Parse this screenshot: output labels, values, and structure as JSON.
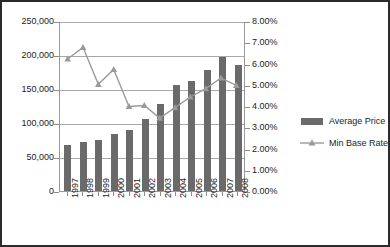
{
  "chart_data": {
    "type": "bar",
    "title": "",
    "subtitle": "",
    "xlabel": "",
    "ylabel": "",
    "categories": [
      "1997",
      "1998",
      "1999",
      "2000",
      "2001",
      "2002",
      "2003",
      "2004",
      "2005",
      "2006",
      "2007",
      "2008"
    ],
    "series": [
      {
        "name": "Average Price",
        "type": "bar",
        "axis": "left",
        "values": [
          67000,
          71500,
          75500,
          84500,
          90000,
          105500,
          128000,
          156500,
          162500,
          178500,
          197000,
          185500
        ]
      },
      {
        "name": "Min Base Rate",
        "type": "line",
        "axis": "right",
        "marker": "triangle",
        "values": [
          6.25,
          6.8,
          5.05,
          5.75,
          4.0,
          4.05,
          3.45,
          3.95,
          4.45,
          4.85,
          5.35,
          5.0
        ]
      }
    ],
    "left_axis": {
      "ticks": [
        "0",
        "50,000",
        "100,000",
        "150,000",
        "200,000",
        "250,000"
      ],
      "tick_values": [
        0,
        50000,
        100000,
        150000,
        200000,
        250000
      ],
      "ylim": [
        0,
        250000
      ]
    },
    "right_axis": {
      "ticks": [
        "0.00%",
        "1.00%",
        "2.00%",
        "3.00%",
        "4.00%",
        "5.00%",
        "6.00%",
        "7.00%",
        "8.00%"
      ],
      "tick_values": [
        0,
        1,
        2,
        3,
        4,
        5,
        6,
        7,
        8
      ],
      "ylim": [
        0,
        8
      ]
    },
    "grid": true,
    "legend": {
      "position": "right",
      "entries": [
        {
          "label": "Average Price",
          "key": "bar",
          "color": "#6a6a6a"
        },
        {
          "label": "Min Base Rate",
          "key": "line-triangle",
          "color": "#9a9a9a"
        }
      ]
    },
    "colors": {
      "bar": "#6a6a6a",
      "line": "#9a9a9a",
      "grid": "#a8a8a8",
      "axis": "#8d8d8d",
      "frame": "#2b2b2b",
      "text": "#1c1c1c",
      "background": "#ffffff"
    }
  }
}
